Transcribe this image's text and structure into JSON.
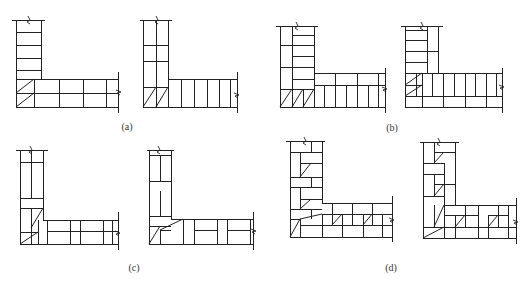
{
  "figure": {
    "line_color": "#222222",
    "background": "#ffffff"
  },
  "labels": {
    "a": "(a)",
    "b": "(b)",
    "c": "(c)",
    "d": "(d)"
  },
  "panels": [
    {
      "id": "a",
      "label": "(a)",
      "courses": [
        "a-course-1",
        "a-course-2"
      ],
      "wall_thickness": "one brick (half-brick courses shown)"
    },
    {
      "id": "b",
      "label": "(b)",
      "courses": [
        "b-course-1",
        "b-course-2"
      ],
      "wall_thickness": "one-and-a-half brick"
    },
    {
      "id": "c",
      "label": "(c)",
      "courses": [
        "c-course-1",
        "c-course-2"
      ],
      "wall_thickness": "one brick, mixed headers/stretchers"
    },
    {
      "id": "d",
      "label": "(d)",
      "courses": [
        "d-course-1",
        "d-course-2"
      ],
      "wall_thickness": "one-and-a-half brick, staggered bond"
    }
  ],
  "icons": {
    "break_mark": "zigzag-break-line"
  }
}
